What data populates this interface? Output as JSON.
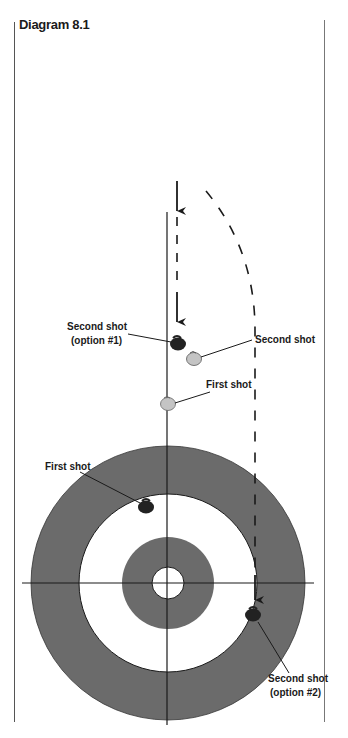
{
  "title": "Diagram 8.1",
  "labels": {
    "second_shot_option1_line1": "Second shot",
    "second_shot_option1_line2": "(option #1)",
    "second_shot": "Second shot",
    "first_shot_upper": "First shot",
    "first_shot_house": "First shot",
    "second_shot_option2_line1": "Second shot",
    "second_shot_option2_line2": "(option #2)"
  },
  "colors": {
    "ring_gray": "#6b6b6b",
    "dark_stone": "#222222",
    "light_stone": "#c4c4c4",
    "line": "#1a1a1a"
  }
}
